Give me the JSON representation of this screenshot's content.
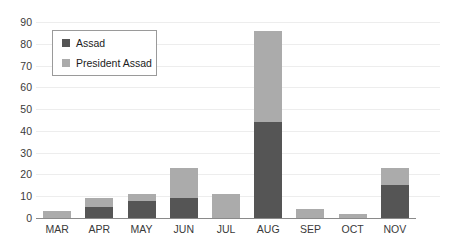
{
  "chart_data": {
    "type": "bar",
    "stacked": true,
    "title": "",
    "xlabel": "",
    "ylabel": "",
    "categories": [
      "MAR",
      "APR",
      "MAY",
      "JUN",
      "JUL",
      "AUG",
      "SEP",
      "OCT",
      "NOV"
    ],
    "series": [
      {
        "name": "Assad",
        "color": "#555555",
        "values": [
          0,
          5,
          8,
          9,
          0,
          44,
          0,
          0,
          15
        ]
      },
      {
        "name": "President Assad",
        "color": "#ababab",
        "values": [
          3,
          4,
          3,
          14,
          11,
          42,
          4,
          2,
          8
        ]
      }
    ],
    "totals": [
      3,
      9,
      11,
      23,
      11,
      86,
      4,
      2,
      23
    ],
    "ylim": [
      0,
      90
    ],
    "ytick_values": [
      0,
      10,
      20,
      30,
      40,
      50,
      60,
      70,
      80,
      90
    ],
    "ytick_labels": [
      "0",
      "10",
      "20",
      "30",
      "40",
      "50",
      "60",
      "70",
      "80",
      "90"
    ],
    "grid": true,
    "legend_position": "upper-left"
  },
  "legend": {
    "entries": [
      {
        "label": "Assad",
        "color": "#555555"
      },
      {
        "label": "President Assad",
        "color": "#ababab"
      }
    ]
  }
}
